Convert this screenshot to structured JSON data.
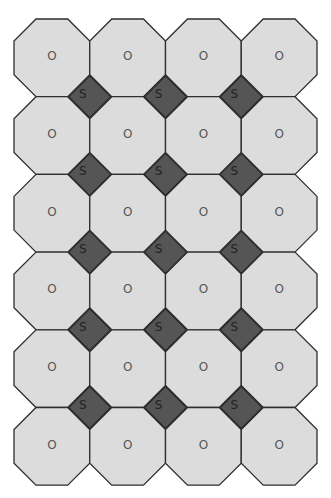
{
  "diagram": {
    "title": "",
    "grid": {
      "rows": 6,
      "cols": 4
    },
    "octagon": {
      "label": "O",
      "fill": "#dcdcdc"
    },
    "square": {
      "label": "S",
      "fill": "#555555"
    },
    "octagon_labels": [
      [
        "O",
        "O",
        "O",
        "O"
      ],
      [
        "O",
        "O",
        "O",
        "O"
      ],
      [
        "O",
        "O",
        "O",
        "O"
      ],
      [
        "O",
        "O",
        "O",
        "O"
      ],
      [
        "O",
        "O",
        "O",
        "O"
      ],
      [
        "O",
        "O",
        "O",
        "O"
      ]
    ],
    "square_labels": [
      [
        "S",
        "S",
        "S"
      ],
      [
        "S",
        "S",
        "S"
      ],
      [
        "S",
        "S",
        "S"
      ],
      [
        "S",
        "S",
        "S"
      ],
      [
        "S",
        "S",
        "S"
      ]
    ]
  }
}
